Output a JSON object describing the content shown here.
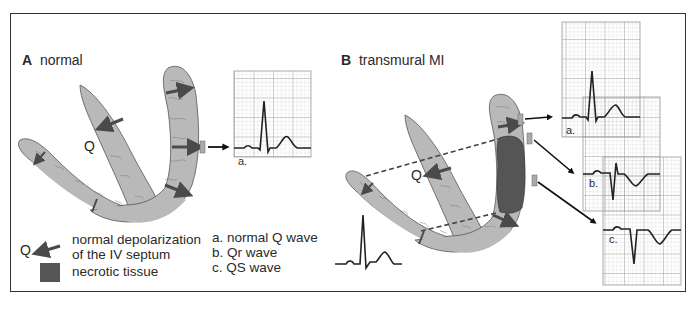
{
  "panels": {
    "a": {
      "letter": "A",
      "title": "normal"
    },
    "b": {
      "letter": "B",
      "title": "transmural MI"
    }
  },
  "labels": {
    "q_a": "Q",
    "q_b": "Q",
    "ecg_a_normal": "a.",
    "ecg_a_mi": "a.",
    "ecg_b_mi": "b.",
    "ecg_c_mi": "c."
  },
  "legend": {
    "q_symbol": "Q",
    "arrow_text_line1": "normal depolarization",
    "arrow_text_line2": "of the IV septum",
    "necrotic_text": "necrotic tissue",
    "wave_a": "a. normal Q wave",
    "wave_b": "b. Qr wave",
    "wave_c": "c. QS wave"
  },
  "colors": {
    "tissue": "#b9b9b9",
    "necrotic": "#555555",
    "arrow": "#4a4a4a",
    "ecg_grid_minor": "#d6d6d6",
    "ecg_grid_major": "#9a9a9a",
    "ecg_trace": "#222222",
    "frame": "#333333"
  }
}
